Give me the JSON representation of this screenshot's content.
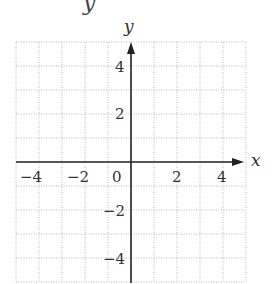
{
  "chart_data": {
    "type": "scatter",
    "title": "",
    "partial_top_text": "y",
    "xlabel": "x",
    "ylabel": "y",
    "xlim": [
      -5,
      5
    ],
    "ylim": [
      -5,
      5
    ],
    "grid": true,
    "grid_style": "dotted",
    "grid_step": 1,
    "x_ticks": [
      -4,
      -2,
      0,
      2,
      4
    ],
    "y_ticks": [
      4,
      2,
      -2,
      -4
    ],
    "x_tick_labels": [
      "−4",
      "−2",
      "0",
      "2",
      "4"
    ],
    "y_tick_labels": [
      "4",
      "2",
      "−2",
      "−4"
    ],
    "series": [],
    "legend": null,
    "colors": {
      "axis": "#222222",
      "grid": "#b8b8b8",
      "text": "#333333"
    }
  },
  "labels": {
    "top_glyph": "y",
    "x_axis": "x",
    "y_axis": "y",
    "x_neg4": "−4",
    "x_neg2": "−2",
    "x_0": "0",
    "x_2": "2",
    "x_4": "4",
    "y_4": "4",
    "y_2": "2",
    "y_neg2": "−2",
    "y_neg4": "−4"
  }
}
